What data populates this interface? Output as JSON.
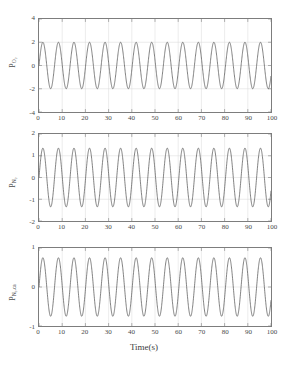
{
  "figure": {
    "xlabel": "Time(s)",
    "background": "#ffffff",
    "line_color": "#555555",
    "axis_color": "#7d7d7d",
    "grid_color": "#d9d9d9"
  },
  "chart_data": [
    {
      "type": "line",
      "title": "",
      "xlabel": "",
      "ylabel": "P_O2",
      "ylabel_base": "P",
      "ylabel_sub": "O₂",
      "xlim": [
        0,
        100
      ],
      "ylim": [
        -4,
        4
      ],
      "xticks": [
        0,
        10,
        20,
        30,
        40,
        50,
        60,
        70,
        80,
        90,
        100
      ],
      "yticks": [
        -4,
        -2,
        0,
        2,
        4
      ],
      "grid": true,
      "legend": "none",
      "waveform": "sine",
      "amplitude": 2.0,
      "offset": 0.0,
      "period": 6.7,
      "phase_deg": 0,
      "cycles": 15,
      "series": [
        {
          "name": "P_O2",
          "x": [
            0,
            1.7,
            3.35,
            5.0,
            6.7,
            8.4,
            10.05,
            11.7,
            13.4,
            15.1,
            16.75,
            18.4,
            20.1,
            21.8,
            23.45,
            25.1,
            26.8,
            28.5,
            30.15,
            31.8,
            33.5,
            35.2,
            36.85,
            38.5,
            40.2,
            41.9,
            43.55,
            45.2,
            46.9,
            48.6,
            50.25,
            51.9,
            53.6,
            55.3,
            56.95,
            58.6,
            60.3,
            62.0,
            63.65,
            65.3,
            67.0,
            68.7,
            70.35,
            72.0,
            73.7,
            75.4,
            77.05,
            78.7,
            80.4,
            82.1,
            83.75,
            85.4,
            87.1,
            88.8,
            90.45,
            92.1,
            93.8,
            95.5,
            97.15,
            98.8,
            100
          ],
          "values": [
            0,
            2,
            0,
            -2,
            0,
            2,
            0,
            -2,
            0,
            2,
            0,
            -2,
            0,
            2,
            0,
            -2,
            0,
            2,
            0,
            -2,
            0,
            2,
            0,
            -2,
            0,
            2,
            0,
            -2,
            0,
            2,
            0,
            -2,
            0,
            2,
            0,
            -2,
            0,
            2,
            0,
            -2,
            0,
            2,
            0,
            -2,
            0,
            2,
            0,
            -2,
            0,
            2,
            0,
            -2,
            0,
            2,
            0,
            -2,
            0,
            2,
            0,
            -2,
            -1.1
          ]
        }
      ]
    },
    {
      "type": "line",
      "title": "",
      "xlabel": "",
      "ylabel": "P_N2",
      "ylabel_base": "P",
      "ylabel_sub": "N₂",
      "xlim": [
        0,
        100
      ],
      "ylim": [
        -2,
        2
      ],
      "xticks": [
        0,
        10,
        20,
        30,
        40,
        50,
        60,
        70,
        80,
        90,
        100
      ],
      "yticks": [
        -2,
        -1,
        0,
        1,
        2
      ],
      "grid": true,
      "legend": "none",
      "waveform": "sine",
      "amplitude": 1.35,
      "offset": 0.0,
      "period": 6.7,
      "phase_deg": 0,
      "cycles": 15,
      "series": [
        {
          "name": "P_N2",
          "x": [
            0,
            1.7,
            3.35,
            5.0,
            6.7,
            8.4,
            10.05,
            11.7,
            13.4,
            15.1,
            16.75,
            18.4,
            20.1,
            21.8,
            23.45,
            25.1,
            26.8,
            28.5,
            30.15,
            31.8,
            33.5,
            35.2,
            36.85,
            38.5,
            40.2,
            41.9,
            43.55,
            45.2,
            46.9,
            48.6,
            50.25,
            51.9,
            53.6,
            55.3,
            56.95,
            58.6,
            60.3,
            62.0,
            63.65,
            65.3,
            67.0,
            68.7,
            70.35,
            72.0,
            73.7,
            75.4,
            77.05,
            78.7,
            80.4,
            82.1,
            83.75,
            85.4,
            87.1,
            88.8,
            90.45,
            92.1,
            93.8,
            95.5,
            97.15,
            98.8,
            100
          ],
          "values": [
            0,
            1.35,
            0,
            -1.35,
            0,
            1.35,
            0,
            -1.35,
            0,
            1.35,
            0,
            -1.35,
            0,
            1.35,
            0,
            -1.35,
            0,
            1.35,
            0,
            -1.35,
            0,
            1.35,
            0,
            -1.35,
            0,
            1.35,
            0,
            -1.35,
            0,
            1.35,
            0,
            -1.35,
            0,
            1.35,
            0,
            -1.35,
            0,
            1.35,
            0,
            -1.35,
            0,
            1.35,
            0,
            -1.35,
            0,
            1.35,
            0,
            -1.35,
            0,
            1.35,
            0,
            -1.35,
            0,
            1.35,
            0,
            -1.35,
            0,
            1.35,
            0,
            -1.35,
            -0.7
          ]
        }
      ]
    },
    {
      "type": "line",
      "title": "",
      "xlabel": "Time(s)",
      "ylabel": "P_N2,ca",
      "ylabel_base": "P",
      "ylabel_sub": "N₂,ca",
      "xlim": [
        0,
        100
      ],
      "ylim": [
        -1,
        1
      ],
      "xticks": [
        0,
        10,
        20,
        30,
        40,
        50,
        60,
        70,
        80,
        90,
        100
      ],
      "yticks": [
        -1,
        0,
        1
      ],
      "grid": true,
      "legend": "none",
      "waveform": "sine",
      "amplitude": 0.75,
      "offset": 0.0,
      "period": 6.7,
      "phase_deg": 0,
      "cycles": 15,
      "series": [
        {
          "name": "P_N2,ca",
          "x": [
            0,
            1.7,
            3.35,
            5.0,
            6.7,
            8.4,
            10.05,
            11.7,
            13.4,
            15.1,
            16.75,
            18.4,
            20.1,
            21.8,
            23.45,
            25.1,
            26.8,
            28.5,
            30.15,
            31.8,
            33.5,
            35.2,
            36.85,
            38.5,
            40.2,
            41.9,
            43.55,
            45.2,
            46.9,
            48.6,
            50.25,
            51.9,
            53.6,
            55.3,
            56.95,
            58.6,
            60.3,
            62.0,
            63.65,
            65.3,
            67.0,
            68.7,
            70.35,
            72.0,
            73.7,
            75.4,
            77.05,
            78.7,
            80.4,
            82.1,
            83.75,
            85.4,
            87.1,
            88.8,
            90.45,
            92.1,
            93.8,
            95.5,
            97.15,
            98.8,
            100
          ],
          "values": [
            0,
            0.75,
            0,
            -0.75,
            0,
            0.75,
            0,
            -0.75,
            0,
            0.75,
            0,
            -0.75,
            0,
            0.75,
            0,
            -0.75,
            0,
            0.75,
            0,
            -0.75,
            0,
            0.75,
            0,
            -0.75,
            0,
            0.75,
            0,
            -0.75,
            0,
            0.75,
            0,
            -0.75,
            0,
            0.75,
            0,
            -0.75,
            0,
            0.75,
            0,
            -0.75,
            0,
            0.75,
            0,
            -0.75,
            0,
            0.75,
            0,
            -0.75,
            0,
            0.75,
            0,
            -0.75,
            0,
            0.75,
            0,
            -0.75,
            0,
            0.75,
            0,
            -0.75,
            -0.4
          ]
        }
      ]
    }
  ]
}
